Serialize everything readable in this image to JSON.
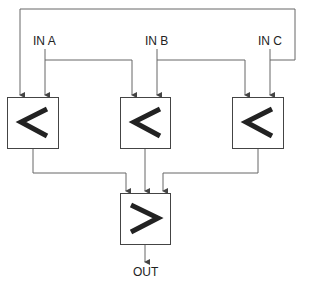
{
  "inputs": [
    {
      "label": "IN A"
    },
    {
      "label": "IN B"
    },
    {
      "label": "IN C"
    }
  ],
  "comparators": [
    {
      "symbol": "<"
    },
    {
      "symbol": "<"
    },
    {
      "symbol": "<"
    }
  ],
  "output_block": {
    "symbol": ">"
  },
  "output": {
    "label": "OUT"
  },
  "colors": {
    "line": "#666666",
    "box": "#444444",
    "symbol": "#222222"
  }
}
